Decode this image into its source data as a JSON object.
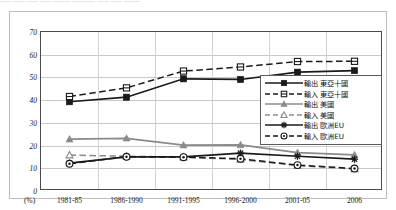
{
  "figure": {
    "top_fragment_text": "── ──   ── ──   ─── ────    ── ──      ───",
    "unit_label": "(%)"
  },
  "chart_data": {
    "type": "line",
    "title": "",
    "subtitle": "",
    "xlabel": "",
    "ylabel": "",
    "unit": "(%)",
    "ylim": [
      0,
      70
    ],
    "yticks": [
      0,
      10,
      20,
      30,
      40,
      50,
      60,
      70
    ],
    "grid": true,
    "legend_position": "inside-right",
    "categories": [
      "1981-85",
      "1986-1990",
      "1991-1995",
      "1996-2000",
      "2001-05",
      "2006"
    ],
    "series": [
      {
        "name": "輸出 東亞十國",
        "values": [
          39.3,
          41.3,
          49.4,
          49.1,
          52.3,
          53.0
        ],
        "color": "#1a1a1a",
        "line": "solid",
        "marker": "filled-square"
      },
      {
        "name": "輸入 東亞十國",
        "values": [
          41.6,
          45.4,
          52.8,
          54.6,
          57.0,
          57.1
        ],
        "color": "#1a1a1a",
        "line": "dashed",
        "marker": "open-square"
      },
      {
        "name": "輸出 美國",
        "values": [
          22.8,
          23.2,
          20.2,
          20.3,
          16.9,
          15.9
        ],
        "color": "#8a8a8a",
        "line": "solid",
        "marker": "filled-triangle"
      },
      {
        "name": "輸入 美國",
        "values": [
          15.8,
          15.3,
          14.9,
          13.9,
          11.2,
          9.7
        ],
        "color": "#8a8a8a",
        "line": "dashed",
        "marker": "open-triangle"
      },
      {
        "name": "輸出 歐洲EU",
        "values": [
          12.3,
          15.0,
          15.0,
          16.7,
          15.3,
          14.0
        ],
        "color": "#1a1a1a",
        "line": "solid",
        "marker": "asterisk"
      },
      {
        "name": "輸入 歐洲EU",
        "values": [
          12.0,
          15.1,
          14.9,
          14.2,
          11.4,
          9.9
        ],
        "color": "#1a1a1a",
        "line": "dashed",
        "marker": "circle-dot"
      }
    ]
  }
}
